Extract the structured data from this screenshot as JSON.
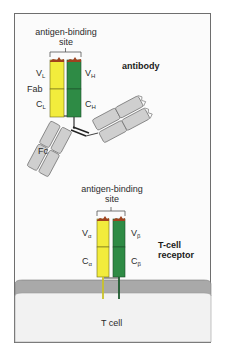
{
  "antibody": {
    "title": "antibody",
    "binding_site_label_line1": "antigen-binding",
    "binding_site_label_line2": "site",
    "fab_label": "Fab",
    "fc_label": "Fc",
    "vl": {
      "main": "V",
      "sub": "L"
    },
    "vh": {
      "main": "V",
      "sub": "H"
    },
    "cl": {
      "main": "C",
      "sub": "L"
    },
    "ch": {
      "main": "C",
      "sub": "H"
    }
  },
  "tcr": {
    "title_line1": "T-cell",
    "title_line2": "receptor",
    "binding_site_label_line1": "antigen-binding",
    "binding_site_label_line2": "site",
    "va": {
      "main": "V",
      "sub": "α"
    },
    "vb": {
      "main": "V",
      "sub": "β"
    },
    "ca": {
      "main": "C",
      "sub": "α"
    },
    "cb": {
      "main": "C",
      "sub": "β"
    }
  },
  "cell": {
    "label": "T cell"
  },
  "colors": {
    "light_chain": "#f2ec3c",
    "heavy_chain": "#2e8b45",
    "constant_gray": "#cfcfcf",
    "binding_site": "#a0421e",
    "membrane": "#a9a9a9",
    "cytoplasm": "#f2f2f2"
  }
}
